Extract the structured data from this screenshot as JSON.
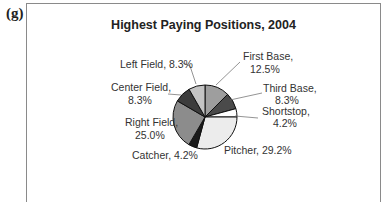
{
  "panel_label": "(g)",
  "chart_data": {
    "type": "pie",
    "title": "Highest Paying Positions, 2004",
    "slices": [
      {
        "label": "First Base",
        "value": 12.5,
        "display": "First Base, 12.5%",
        "color": "#9e9e9e"
      },
      {
        "label": "Third Base",
        "value": 8.3,
        "display": "Third Base, 8.3%",
        "color": "#4a4a4a"
      },
      {
        "label": "Shortstop",
        "value": 4.2,
        "display": "Shortstop, 4.2%",
        "color": "#ffffff"
      },
      {
        "label": "Pitcher",
        "value": 29.2,
        "display": "Pitcher, 29.2%",
        "color": "#ececec"
      },
      {
        "label": "Catcher",
        "value": 4.2,
        "display": "Catcher, 4.2%",
        "color": "#1a1a1a"
      },
      {
        "label": "Right Field",
        "value": 25.0,
        "display": "Right Field, 25.0%",
        "color": "#8c8c8c"
      },
      {
        "label": "Center Field",
        "value": 8.3,
        "display": "Center Field, 8.3%",
        "color": "#3c3c3c"
      },
      {
        "label": "Left Field",
        "value": 8.3,
        "display": "Left Field, 8.3%",
        "color": "#c4c4c4"
      }
    ],
    "start_angle_deg": 0,
    "direction": "clockwise",
    "legend": "none (callout labels)"
  },
  "labels": {
    "first_base_1": "First Base,",
    "first_base_2": "12.5%",
    "third_base_1": "Third Base,",
    "third_base_2": "8.3%",
    "shortstop_1": "Shortstop,",
    "shortstop_2": "4.2%",
    "pitcher": "Pitcher, 29.2%",
    "catcher": "Catcher, 4.2%",
    "right_field_1": "Right Field,",
    "right_field_2": "25.0%",
    "center_field_1": "Center Field,",
    "center_field_2": "8.3%",
    "left_field": "Left Field, 8.3%"
  }
}
